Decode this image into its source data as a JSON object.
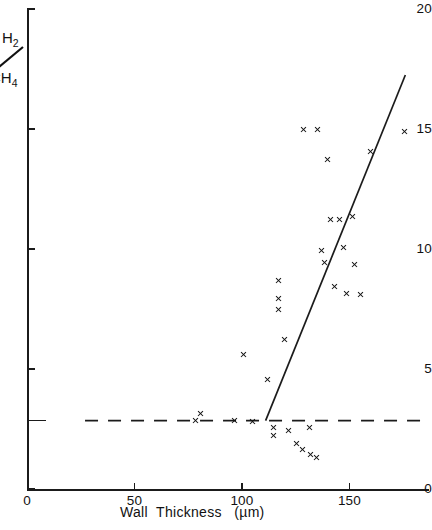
{
  "chart_data": {
    "type": "scatter",
    "title": "",
    "xlabel": "Wall  Thickness   (µm)",
    "ylabel": "H2/CH4",
    "ylabel_numerator": "H",
    "ylabel_numerator_sub": "2",
    "ylabel_denominator": "CH",
    "ylabel_denominator_sub": "4",
    "xlim": [
      0,
      187
    ],
    "ylim": [
      0,
      20
    ],
    "xticks": [
      0,
      50,
      100,
      150
    ],
    "xtick_labels": [
      "0",
      "50",
      "100",
      "150"
    ],
    "yticks": [
      0,
      5,
      10,
      15,
      20
    ],
    "ytick_labels": [
      "0",
      "5",
      "10",
      "15",
      "20"
    ],
    "grid": false,
    "legend": "none",
    "marker": "x",
    "marker_color": "#111111",
    "line_color": "#1b1b1b",
    "points": [
      {
        "x": 78.5,
        "y": 2.85
      },
      {
        "x": 80.5,
        "y": 3.15
      },
      {
        "x": 96.5,
        "y": 2.85
      },
      {
        "x": 105.0,
        "y": 2.8
      },
      {
        "x": 100.5,
        "y": 5.6
      },
      {
        "x": 112.0,
        "y": 4.55
      },
      {
        "x": 114.5,
        "y": 2.55
      },
      {
        "x": 114.5,
        "y": 2.25
      },
      {
        "x": 117.0,
        "y": 8.7
      },
      {
        "x": 117.0,
        "y": 7.95
      },
      {
        "x": 117.0,
        "y": 7.5
      },
      {
        "x": 120.0,
        "y": 6.25
      },
      {
        "x": 121.5,
        "y": 2.45
      },
      {
        "x": 125.5,
        "y": 1.9
      },
      {
        "x": 128.0,
        "y": 1.65
      },
      {
        "x": 131.5,
        "y": 2.55
      },
      {
        "x": 132.0,
        "y": 1.45
      },
      {
        "x": 134.5,
        "y": 1.3
      },
      {
        "x": 128.5,
        "y": 15.0
      },
      {
        "x": 135.0,
        "y": 15.0
      },
      {
        "x": 137.0,
        "y": 9.95
      },
      {
        "x": 138.5,
        "y": 9.45
      },
      {
        "x": 140.0,
        "y": 13.75
      },
      {
        "x": 141.0,
        "y": 11.25
      },
      {
        "x": 143.0,
        "y": 8.45
      },
      {
        "x": 145.5,
        "y": 11.25
      },
      {
        "x": 147.0,
        "y": 10.05
      },
      {
        "x": 148.5,
        "y": 8.15
      },
      {
        "x": 151.5,
        "y": 11.35
      },
      {
        "x": 152.5,
        "y": 9.35
      },
      {
        "x": 155.0,
        "y": 8.1
      },
      {
        "x": 160.0,
        "y": 14.05
      },
      {
        "x": 175.5,
        "y": 14.9
      }
    ],
    "trend_line": {
      "label": "fitted-line",
      "x0": 111.0,
      "y0": 2.85,
      "x1": 176.0,
      "y1": 17.25,
      "style": "solid"
    },
    "reference_line": {
      "label": "baseline-dashed-line",
      "y": 2.85,
      "x0": 27.0,
      "x1": 185.0,
      "style": "dashed"
    }
  }
}
